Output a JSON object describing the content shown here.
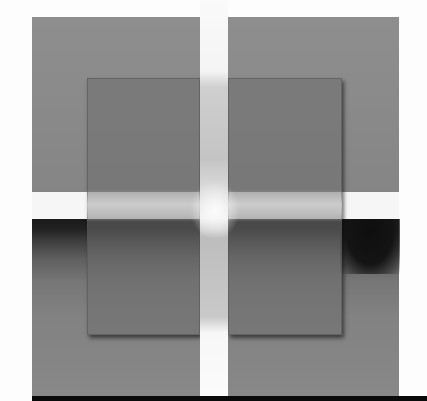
{
  "image": {
    "description": "Grayscale composition: two gray upper squares separated by a white vertical strip, two darker overlapping inner squares, a dark horizontal band across the middle, and a black bar at the bottom",
    "colors": {
      "background": "#fdfdfd",
      "outer_square": "#8a8a8a",
      "inner_square": "#6e6e6e",
      "dark_band": "#1a1a1a",
      "light_strip": "#f4f4f4",
      "bottom_bar": "#0a0a0a"
    },
    "regions": [
      {
        "name": "outer-square-top-left",
        "x": 32,
        "y": 17,
        "w": 168,
        "h": 175
      },
      {
        "name": "outer-square-top-right",
        "x": 228,
        "y": 17,
        "w": 171,
        "h": 175
      },
      {
        "name": "bottom-block",
        "x": 32,
        "y": 219,
        "w": 367,
        "h": 177
      },
      {
        "name": "inner-square-left",
        "x": 87,
        "y": 78,
        "w": 113,
        "h": 257
      },
      {
        "name": "inner-square-right",
        "x": 228,
        "y": 78,
        "w": 114,
        "h": 257
      },
      {
        "name": "vertical-light-strip",
        "x": 200,
        "y": 0,
        "w": 28,
        "h": 396
      },
      {
        "name": "bottom-bar",
        "x": 32,
        "y": 396,
        "w": 395,
        "h": 5
      }
    ]
  }
}
